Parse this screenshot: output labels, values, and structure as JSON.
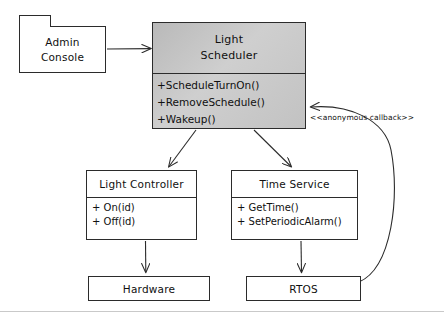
{
  "diagram": {
    "type": "uml-class-diagram",
    "style": "hand-drawn",
    "highlight_color": "#c6c6c6",
    "line_color": "#2b2b2b"
  },
  "nodes": {
    "admin_console": {
      "title_line1": "Admin",
      "title_line2": "Console",
      "shape": "package"
    },
    "light_scheduler": {
      "title_line1": "Light",
      "title_line2": "Scheduler",
      "highlighted": true,
      "operations": [
        "+ScheduleTurnOn()",
        "+RemoveSchedule()",
        "+Wakeup()"
      ]
    },
    "light_controller": {
      "title": "Light Controller",
      "operations": [
        "+ On(id)",
        "+ Off(id)"
      ]
    },
    "time_service": {
      "title": "Time Service",
      "operations": [
        "+ GetTime()",
        "+ SetPeriodicAlarm()"
      ]
    },
    "hardware": {
      "title": "Hardware"
    },
    "rtos": {
      "title": "RTOS"
    }
  },
  "annotations": {
    "callback_stereotype": "<<anonymous callback>>"
  },
  "edges": [
    {
      "from": "admin_console",
      "to": "light_scheduler",
      "kind": "arrow"
    },
    {
      "from": "light_scheduler",
      "to": "light_controller",
      "kind": "arrow"
    },
    {
      "from": "light_scheduler",
      "to": "time_service",
      "kind": "arrow"
    },
    {
      "from": "light_controller",
      "to": "hardware",
      "kind": "arrow"
    },
    {
      "from": "time_service",
      "to": "rtos",
      "kind": "arrow"
    },
    {
      "from": "rtos",
      "to": "light_scheduler",
      "kind": "curved-arrow",
      "label": "<<anonymous callback>>"
    }
  ]
}
